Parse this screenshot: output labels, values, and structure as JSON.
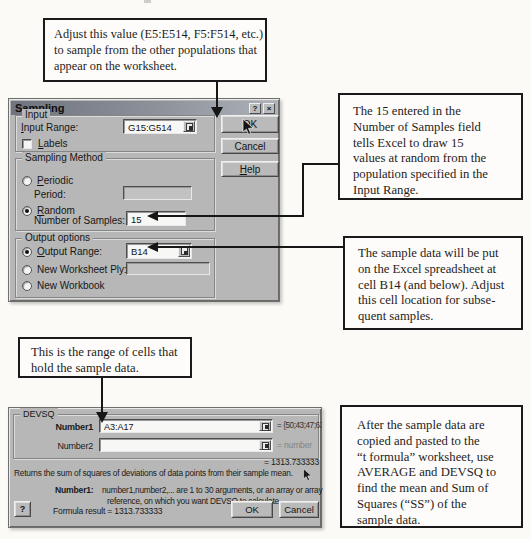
{
  "callouts": {
    "adjust_value": {
      "lines": [
        "Adjust this value (E5:E514, F5:F514, etc.)",
        "to sample from the other populations that",
        "appear on the worksheet."
      ]
    },
    "number_of_samples": {
      "lines": [
        "The 15 entered in the",
        "Number of Samples field",
        "tells Excel to draw 15",
        "values at random from the",
        "population specified in the",
        "Input Range."
      ]
    },
    "output_location": {
      "lines": [
        "The sample data will be put",
        "on the Excel spreadsheet at",
        "cell B14 (and below). Adjust",
        "this cell location for subse-",
        "quent samples."
      ]
    },
    "sample_range": {
      "lines": [
        "This is the range of cells that",
        "hold the sample data."
      ]
    },
    "devsq_usage": {
      "lines": [
        "After the sample data are",
        "copied and pasted to the",
        "“t formula” worksheet, use",
        "AVERAGE and DEVSQ to",
        "find the mean and Sum of",
        "Squares (“SS”) of the",
        "sample data."
      ]
    }
  },
  "sampling_dialog": {
    "title": "Sampling",
    "titlebar": {
      "help_glyph": "?",
      "close_glyph": "×"
    },
    "input_group": {
      "label": "Input",
      "input_range_label": "Input Range:",
      "input_range_value": "G15:G514",
      "labels_label": "Labels",
      "labels_checked": false
    },
    "method_group": {
      "label": "Sampling Method",
      "periodic_label": "Periodic",
      "period_label": "Period:",
      "period_value": "",
      "random_label": "Random",
      "number_of_samples_label": "Number of Samples:",
      "number_of_samples_value": "15",
      "selected": "Random"
    },
    "output_group": {
      "label": "Output options",
      "output_range_label": "Output Range:",
      "output_range_value": "B14",
      "new_worksheet_label": "New Worksheet Ply:",
      "new_worksheet_value": "",
      "new_workbook_label": "New Workbook",
      "selected": "Output Range"
    },
    "buttons": {
      "ok": "OK",
      "cancel": "Cancel",
      "help": "Help"
    }
  },
  "devsq_dialog": {
    "group_label": "DEVSQ",
    "number1_label": "Number1",
    "number1_value": "A3:A17",
    "number1_result": "= {50;43;47;63;61;37",
    "number2_label": "Number2",
    "number2_value": "",
    "number2_result": "= number",
    "result_value": "= 1313.733333",
    "description": "Returns the sum of squares of deviations of data points from their sample mean.",
    "help_term": "Number1:",
    "help_line1": "number1,number2,... are 1 to 30 arguments, or an array or array",
    "help_line2": "reference, on which you want DEVSQ to calculate.",
    "help_button_glyph": "?",
    "formula_result": "Formula result = 1313.733333",
    "buttons": {
      "ok": "OK",
      "cancel": "Cancel"
    }
  },
  "colors": {
    "dialog_face": "#b7b7b7",
    "titlebar_dark": "#70747e",
    "titlebar_light": "#adb2ba",
    "callout_border": "#1a1a1a",
    "arrow": "#161616"
  }
}
